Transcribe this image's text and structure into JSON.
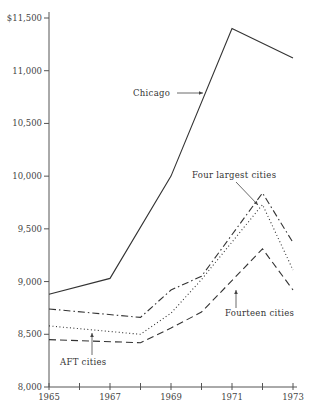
{
  "chart_data": {
    "type": "line",
    "title": "",
    "xlabel": "",
    "ylabel": "",
    "ylim": [
      8000,
      11500
    ],
    "xlim": [
      1965,
      1973
    ],
    "grid": false,
    "legend_position": "inline labels with arrows",
    "y_ticks": [
      {
        "value": 8000,
        "label": "8,000"
      },
      {
        "value": 8500,
        "label": "8,500"
      },
      {
        "value": 9000,
        "label": "9,000"
      },
      {
        "value": 9500,
        "label": "9,500"
      },
      {
        "value": 10000,
        "label": "10,000"
      },
      {
        "value": 10500,
        "label": "10,500"
      },
      {
        "value": 11000,
        "label": "11,000"
      },
      {
        "value": 11500,
        "label": "$11,500"
      }
    ],
    "x_ticks": [
      {
        "value": 1965,
        "label": "1965"
      },
      {
        "value": 1966,
        "label": ""
      },
      {
        "value": 1967,
        "label": "1967"
      },
      {
        "value": 1968,
        "label": ""
      },
      {
        "value": 1969,
        "label": "1969"
      },
      {
        "value": 1970,
        "label": ""
      },
      {
        "value": 1971,
        "label": "1971"
      },
      {
        "value": 1972,
        "label": ""
      },
      {
        "value": 1973,
        "label": "1973"
      }
    ],
    "series": [
      {
        "name": "Chicago",
        "style": "solid",
        "x": [
          1965,
          1967,
          1969,
          1971,
          1973
        ],
        "values": [
          8880,
          9030,
          10000,
          11400,
          11120
        ],
        "label": {
          "text": "Chicago",
          "x": 133,
          "y": 96,
          "arrow": [
            [
              177,
              93
            ],
            [
              203,
              93
            ]
          ]
        }
      },
      {
        "name": "Four largest cities",
        "style": "dashdot",
        "x": [
          1965,
          1968,
          1969,
          1970,
          1972,
          1973
        ],
        "values": [
          8740,
          8660,
          8920,
          9050,
          9840,
          9370
        ],
        "label": {
          "text": "Four largest cities",
          "x": 192,
          "y": 178,
          "arrow": [
            [
              236,
              182
            ],
            [
              258,
              205
            ]
          ]
        }
      },
      {
        "name": "AFT cities",
        "style": "dotted",
        "x": [
          1965,
          1968,
          1969,
          1970,
          1972,
          1973
        ],
        "values": [
          8580,
          8500,
          8700,
          9020,
          9730,
          9110
        ],
        "label": {
          "text": "AFT cities",
          "x": 60,
          "y": 365,
          "arrow": [
            [
              92,
              355
            ],
            [
              92,
              333
            ]
          ]
        }
      },
      {
        "name": "Fourteen cities",
        "style": "dashed",
        "x": [
          1965,
          1968,
          1969,
          1970,
          1972,
          1973
        ],
        "values": [
          8450,
          8420,
          8560,
          8710,
          9310,
          8920
        ],
        "label": {
          "text": "Fourteen cities",
          "x": 225,
          "y": 316,
          "arrow": [
            [
              236,
              308
            ],
            [
              236,
              290
            ]
          ]
        }
      }
    ]
  }
}
